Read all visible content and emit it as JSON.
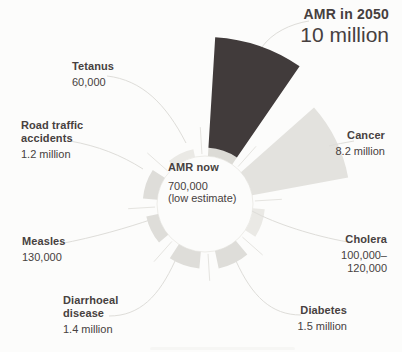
{
  "title": {
    "line1": "AMR in 2050",
    "line2": "10 million"
  },
  "center_label": {
    "name": "AMR now",
    "value": "700,000",
    "note": "(low estimate)"
  },
  "labels": {
    "tetanus": {
      "name_lines": [
        "Tetanus"
      ],
      "value_lines": [
        "60,000"
      ]
    },
    "road_traffic": {
      "name_lines": [
        "Road traffic",
        "accidents"
      ],
      "value_lines": [
        "1.2 million"
      ]
    },
    "measles": {
      "name_lines": [
        "Measles"
      ],
      "value_lines": [
        "130,000"
      ]
    },
    "diarrhoeal": {
      "name_lines": [
        "Diarrhoeal",
        "disease"
      ],
      "value_lines": [
        "1.4 million"
      ]
    },
    "cancer": {
      "name_lines": [
        "Cancer"
      ],
      "value_lines": [
        "8.2 million"
      ]
    },
    "cholera": {
      "name_lines": [
        "Cholera"
      ],
      "value_lines": [
        "100,000–",
        "120,000"
      ]
    },
    "diabetes": {
      "name_lines": [
        "Diabetes"
      ],
      "value_lines": [
        "1.5 million"
      ]
    }
  },
  "colors": {
    "dark_wedge": "#413b3b",
    "light_wedge": "#e3e2de",
    "stub": "#deddd9",
    "stub_faint": "#eae9e5",
    "amr_base": "#dcdbd6",
    "leader": "#deddd9",
    "spoke": "#e5e4e0",
    "ring_outline": "#edece8",
    "text": "#474140",
    "background": "#fcfcfb"
  },
  "chart_data": {
    "type": "pie",
    "variant": "radial rose — wedge length proportional to annual deaths",
    "center_text": "AMR now 700,000 (low estimate)",
    "legend_position": "none",
    "sectors": [
      {
        "label": "AMR in 2050",
        "deaths_label": "10 million",
        "value_millions": 10,
        "color_role": "dark_wedge",
        "base": {
          "label": "AMR now",
          "deaths_label": "700,000 (low estimate)",
          "value_millions": 0.7,
          "color_role": "amr_base"
        }
      },
      {
        "label": "Cancer",
        "deaths_label": "8.2 million",
        "value_millions": 8.2,
        "color_role": "light_wedge"
      },
      {
        "label": "Cholera",
        "deaths_label": "100,000–120,000",
        "value_millions": 0.11,
        "color_role": "stub_faint"
      },
      {
        "label": "Diabetes",
        "deaths_label": "1.5 million",
        "value_millions": 1.5,
        "color_role": "stub"
      },
      {
        "label": "Diarrhoeal disease",
        "deaths_label": "1.4 million",
        "value_millions": 1.4,
        "color_role": "stub"
      },
      {
        "label": "Measles",
        "deaths_label": "130,000",
        "value_millions": 0.13,
        "color_role": "stub"
      },
      {
        "label": "Road traffic accidents",
        "deaths_label": "1.2 million",
        "value_millions": 1.2,
        "color_role": "stub"
      },
      {
        "label": "Tetanus",
        "deaths_label": "60,000",
        "value_millions": 0.06,
        "color_role": "stub_faint"
      }
    ],
    "layout": {
      "center": [
        205,
        204
      ],
      "inner_radius_px": 48,
      "max_radius_px": 167,
      "start_angle_deg": 19,
      "sector_step_deg": 45,
      "big_wedge_half_deg": 15.5,
      "stub_half_deg": 14
    }
  }
}
